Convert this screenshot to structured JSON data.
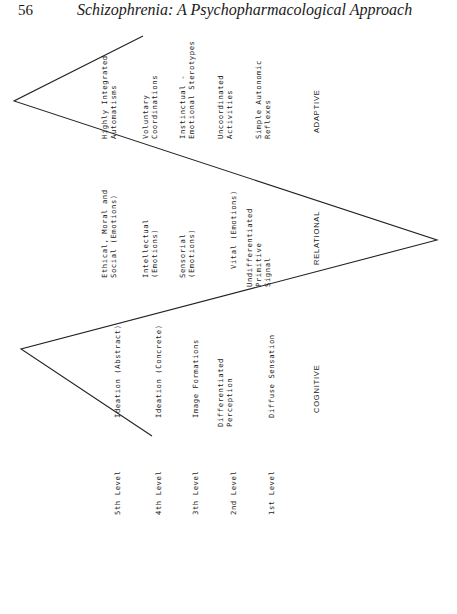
{
  "header": {
    "page_number": "56",
    "running_title": "Schizophrenia: A Psychopharmacological Approach"
  },
  "diagram": {
    "line_color": "#222222",
    "polyline": [
      [
        152,
        436
      ],
      [
        21,
        349
      ],
      [
        437,
        240
      ],
      [
        14,
        101
      ],
      [
        143,
        36
      ]
    ],
    "levels": [
      "5th Level",
      "4th Level",
      "3th Level",
      "2nd Level",
      "1st Level"
    ],
    "cognitive": {
      "label": "COGNITIVE",
      "items": [
        "Ideation (Abstract)",
        "Ideation (Concrete)",
        "Image Formations",
        "Differentiated\nPerception",
        "Diffuse Sensation"
      ]
    },
    "relational": {
      "label": "RELATIONAL",
      "items": [
        "Ethical, Moral and\nSocial (Emotions)",
        "Intellectual\n(Emotions)",
        "Sensorial\n(Emotions)",
        "Vital (Emotions)",
        "Undifferentiated\nPrimitive\nSignal"
      ]
    },
    "adaptive": {
      "label": "ADAPTIVE",
      "items": [
        "Highly Integrated\nAutomatisms",
        "Voluntary\nCoordinations",
        "Instinctual -\nEmotional Sterotypes",
        "Uncoordinated\nActivities",
        "Simple Autonomic\nReflexes"
      ]
    }
  }
}
